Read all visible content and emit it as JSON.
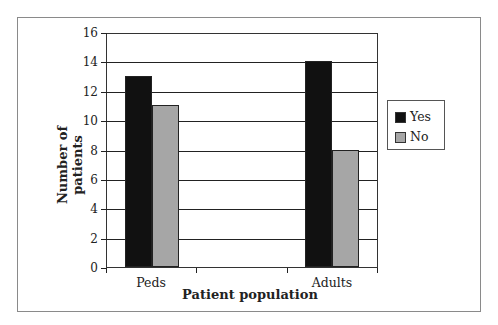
{
  "chart_data": {
    "type": "bar",
    "title": "",
    "xlabel": "Patient population",
    "ylabel": "Number of patients",
    "categories": [
      "Peds",
      "Adults"
    ],
    "series": [
      {
        "name": "Yes",
        "color": "#111111",
        "values": [
          13,
          14
        ]
      },
      {
        "name": "No",
        "color": "#a6a6a6",
        "values": [
          11,
          8
        ]
      }
    ],
    "ylim": [
      0,
      16
    ],
    "yticks": [
      0,
      2,
      4,
      6,
      8,
      10,
      12,
      14,
      16
    ],
    "grid": true,
    "legend_position": "right"
  },
  "axes": {
    "xlabel": "Patient population",
    "ylabel": "Number of patients",
    "yticks": [
      "0",
      "2",
      "4",
      "6",
      "8",
      "10",
      "12",
      "14",
      "16"
    ],
    "categories": [
      "Peds",
      "Adults"
    ]
  },
  "legend": {
    "items": [
      {
        "label": "Yes",
        "color": "#111111"
      },
      {
        "label": "No",
        "color": "#a6a6a6"
      }
    ]
  }
}
